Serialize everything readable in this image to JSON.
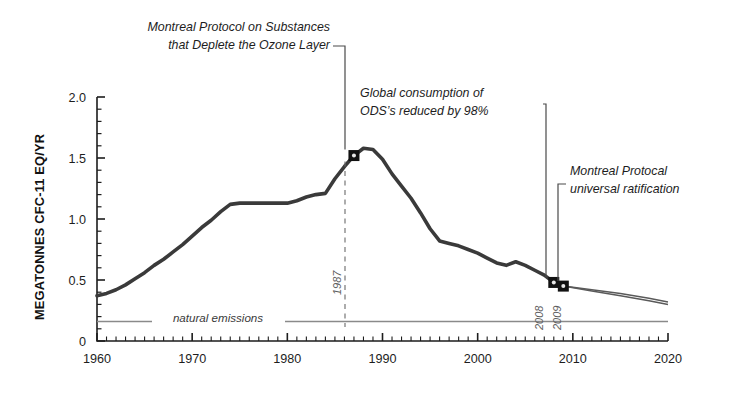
{
  "figure": {
    "background": "#ffffff",
    "series_color": "#3a3a3a",
    "axis_color": "#1d1d1d",
    "annotation_color": "#1d1d1d",
    "natural_line_color": "#8a8a8a",
    "marker_color": "#111111"
  },
  "axes": {
    "ylabel": "MEGATONNES CFC-11 EQ/YR",
    "ytick_labels": [
      "2.0",
      "1.5",
      "1.0",
      "0.5",
      "0"
    ],
    "ytick_values": [
      2.0,
      1.5,
      1.0,
      0.5,
      0
    ],
    "xtick_labels": [
      "1960",
      "1970",
      "1980",
      "1990",
      "2000",
      "2010",
      "2020"
    ],
    "xtick_values": [
      1960,
      1970,
      1980,
      1990,
      2000,
      2010,
      2020
    ],
    "xlim": [
      1960,
      2020
    ],
    "ylim": [
      0,
      2.0
    ],
    "minor_tick_interval_x": 1,
    "minor_tick_interval_y": 0.1,
    "grid": false
  },
  "annotations": [
    {
      "name": "montreal-protocol-substances",
      "line1": "Montreal Protocol on Substances",
      "line2": "that Deplete the Ozone Layer",
      "target_year": 1987,
      "target_value": 1.52
    },
    {
      "name": "global-consumption-reduced",
      "line1": "Global consumption of",
      "line2": "ODS’s reduced by 98%",
      "target_year": 2008,
      "target_value": 0.48
    },
    {
      "name": "universal-ratification",
      "line1": "Montreal Protocal",
      "line2": "universal ratification",
      "target_year": 2009,
      "target_value": 0.45
    }
  ],
  "inline_labels": {
    "natural_emissions": "natural emissions",
    "natural_emissions_value": 0.16,
    "year_1987": "1987",
    "year_2008": "2008",
    "year_2009": "2009"
  },
  "chart_data": {
    "type": "line",
    "title": "",
    "xlabel": "",
    "ylabel": "MEGATONNES CFC-11 EQ/YR",
    "xlim": [
      1960,
      2020
    ],
    "ylim": [
      0,
      2.0
    ],
    "grid": false,
    "legend": "none",
    "series": [
      {
        "name": "Global ODS consumption (CFC-11 equivalent)",
        "color": "#3a3a3a",
        "x": [
          1960,
          1961,
          1962,
          1963,
          1964,
          1965,
          1966,
          1967,
          1968,
          1969,
          1970,
          1971,
          1972,
          1973,
          1974,
          1975,
          1976,
          1977,
          1978,
          1979,
          1980,
          1981,
          1982,
          1983,
          1984,
          1985,
          1986,
          1987,
          1988,
          1989,
          1990,
          1991,
          1992,
          1993,
          1994,
          1995,
          1996,
          1997,
          1998,
          1999,
          2000,
          2001,
          2002,
          2003,
          2004,
          2005,
          2006,
          2007,
          2008,
          2009
        ],
        "y": [
          0.37,
          0.39,
          0.42,
          0.46,
          0.51,
          0.56,
          0.62,
          0.67,
          0.73,
          0.79,
          0.86,
          0.93,
          0.99,
          1.06,
          1.12,
          1.13,
          1.13,
          1.13,
          1.13,
          1.13,
          1.13,
          1.15,
          1.18,
          1.2,
          1.21,
          1.33,
          1.43,
          1.52,
          1.58,
          1.57,
          1.49,
          1.37,
          1.27,
          1.17,
          1.05,
          0.92,
          0.82,
          0.8,
          0.78,
          0.75,
          0.72,
          0.68,
          0.64,
          0.62,
          0.65,
          0.62,
          0.58,
          0.54,
          0.48,
          0.45
        ]
      },
      {
        "name": "Projection upper bound",
        "color": "#5a5a5a",
        "x": [
          2009,
          2012,
          2015,
          2018,
          2020
        ],
        "y": [
          0.45,
          0.42,
          0.39,
          0.35,
          0.32
        ]
      },
      {
        "name": "Projection lower bound",
        "color": "#5a5a5a",
        "x": [
          2009,
          2012,
          2015,
          2018,
          2020
        ],
        "y": [
          0.45,
          0.41,
          0.37,
          0.33,
          0.3
        ]
      }
    ],
    "reference_lines": [
      {
        "name": "natural emissions",
        "value": 0.16,
        "orientation": "horizontal",
        "color": "#8a8a8a"
      }
    ],
    "markers": [
      {
        "name": "peak-1987",
        "x": 1987,
        "y": 1.52,
        "label": "1987"
      },
      {
        "name": "point-2008",
        "x": 2008,
        "y": 0.48,
        "label": "2008"
      },
      {
        "name": "point-2009",
        "x": 2009,
        "y": 0.45,
        "label": "2009"
      }
    ],
    "annotations": [
      {
        "text": "Montreal Protocol on Substances that Deplete the Ozone Layer",
        "points_to": 1987
      },
      {
        "text": "Global consumption of ODS’s reduced by 98%",
        "points_to": 2008
      },
      {
        "text": "Montreal Protocal universal ratification",
        "points_to": 2009
      }
    ]
  }
}
